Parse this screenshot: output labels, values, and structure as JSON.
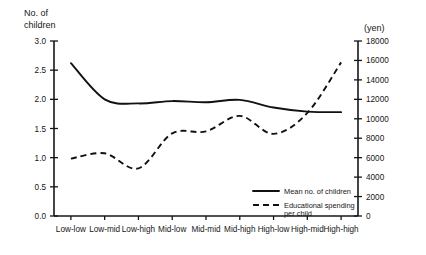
{
  "chart_data": {
    "type": "line",
    "title": "",
    "categories": [
      "Low-low",
      "Low-mid",
      "Low-high",
      "Mid-low",
      "Mid-mid",
      "Mid-high",
      "High-low",
      "High-mid",
      "High-high"
    ],
    "left_axis": {
      "label_line1": "No. of",
      "label_line2": "children",
      "ticks": [
        "0.0",
        "0.5",
        "1.0",
        "1.5",
        "2.0",
        "2.5",
        "3.0"
      ],
      "min": 0,
      "max": 3,
      "step": 0.5
    },
    "right_axis": {
      "label": "(yen)",
      "ticks": [
        "0",
        "2000",
        "4000",
        "6000",
        "8000",
        "10000",
        "12000",
        "14000",
        "16000",
        "18000"
      ],
      "min": 0,
      "max": 18000,
      "step": 2000
    },
    "grid": false,
    "legend_position": "inside-bottom-right",
    "series": [
      {
        "name": "Mean no. of children",
        "axis": "left",
        "style": "solid",
        "values": [
          2.62,
          2.0,
          1.93,
          1.97,
          1.95,
          1.99,
          1.86,
          1.79,
          1.78
        ]
      },
      {
        "name": "Educational spending per child",
        "axis": "right",
        "style": "dashed",
        "values": [
          5900,
          6450,
          4900,
          8500,
          8700,
          10300,
          8450,
          10600,
          15800
        ]
      }
    ],
    "colors": {
      "axis": "#161616",
      "series_solid": "#111111",
      "series_dashed": "#111111",
      "background": "#ffffff"
    }
  },
  "legend": {
    "items": [
      {
        "label": "Mean no. of children",
        "style": "solid"
      },
      {
        "label_line1": "Educational spending",
        "label_line2": "per child",
        "style": "dashed"
      }
    ]
  }
}
